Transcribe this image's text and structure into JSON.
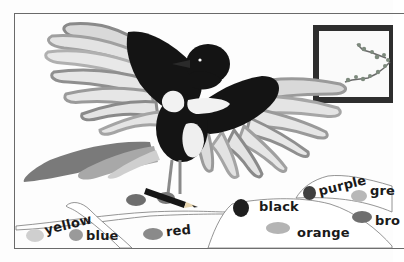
{
  "illustration": {
    "subject": "magpie",
    "holding": "pencil",
    "palette": {
      "background": "#fdfdfd",
      "frame": "#6a6a6a",
      "bird_black": "#141414",
      "bird_white": "#f2f2f2",
      "feather_light": "#d6d6d6",
      "feather_mid": "#a9a9a9",
      "feather_dark": "#7c7c7c",
      "window_frame": "#2e2e2e"
    }
  },
  "color_words": [
    {
      "label": "yellow",
      "swatch_color": "#cfcfcf"
    },
    {
      "label": "blue",
      "swatch_color": "#9a9a9a"
    },
    {
      "label": "red",
      "swatch_color": "#8a8a8a"
    },
    {
      "label": "black",
      "swatch_color": "#1e1e1e"
    },
    {
      "label": "orange",
      "swatch_color": "#b4b4b4"
    },
    {
      "label": "purple",
      "swatch_color": "#3e3e3e"
    },
    {
      "label": "gre",
      "swatch_color": "#b8b8b8"
    },
    {
      "label": "bro",
      "swatch_color": "#6e6e6e"
    }
  ]
}
